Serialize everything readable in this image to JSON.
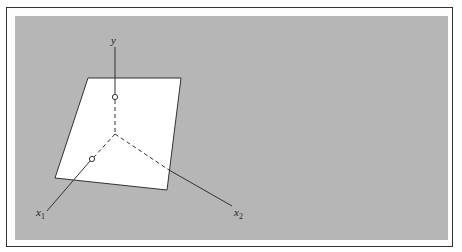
{
  "figure": {
    "background_color": "#b6b6b6",
    "plane_color": "#ffffff",
    "line_color": "#333333",
    "axes": [
      {
        "id": "y",
        "label": "y",
        "subscript": ""
      },
      {
        "id": "x1",
        "label": "x",
        "subscript": "1"
      },
      {
        "id": "x2",
        "label": "x",
        "subscript": "2"
      }
    ],
    "points": [
      {
        "on_axis": "y",
        "marker": "open-circle"
      },
      {
        "on_axis": "x1",
        "marker": "open-circle"
      }
    ]
  }
}
